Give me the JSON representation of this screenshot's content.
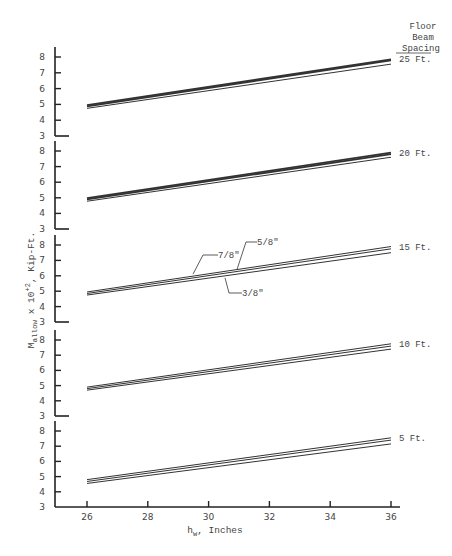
{
  "chart_data": {
    "type": "line",
    "title": "",
    "xlabel": "h_w, Inches",
    "xlabel_main": "h",
    "xlabel_sub": "w",
    "xlabel_rest": ", Inches",
    "ylabel": "M_allow x 10^+2, Kip-Ft.",
    "ylabel_main": "M",
    "ylabel_sub": "allow",
    "ylabel_mid": " x 10",
    "ylabel_sup": "+2",
    "ylabel_rest": ", Kip-Ft.",
    "x_ticks": [
      26,
      28,
      30,
      32,
      34,
      36
    ],
    "y_ticks": [
      3,
      4,
      5,
      6,
      7,
      8
    ],
    "xlim": [
      25,
      36.5
    ],
    "ylim": [
      3,
      8.5
    ],
    "legend_header": [
      "Floor",
      "Beam",
      "Spacing"
    ],
    "series_names": [
      "7/8\"",
      "5/8\"",
      "3/8\""
    ],
    "panels": [
      {
        "label": "25 Ft.",
        "series": [
          {
            "name": "7/8\"",
            "x": [
              26,
              36
            ],
            "values": [
              4.95,
              7.85
            ]
          },
          {
            "name": "5/8\"",
            "x": [
              26,
              36
            ],
            "values": [
              4.88,
              7.78
            ]
          },
          {
            "name": "3/8\"",
            "x": [
              26,
              36
            ],
            "values": [
              4.75,
              7.55
            ]
          }
        ]
      },
      {
        "label": "20 Ft.",
        "series": [
          {
            "name": "7/8\"",
            "x": [
              26,
              36
            ],
            "values": [
              4.98,
              7.9
            ]
          },
          {
            "name": "5/8\"",
            "x": [
              26,
              36
            ],
            "values": [
              4.9,
              7.8
            ]
          },
          {
            "name": "3/8\"",
            "x": [
              26,
              36
            ],
            "values": [
              4.78,
              7.6
            ]
          }
        ]
      },
      {
        "label": "15 Ft.",
        "annotations": [
          "7/8\"",
          "5/8\"",
          "3/8\""
        ],
        "series": [
          {
            "name": "7/8\"",
            "x": [
              26,
              36
            ],
            "values": [
              4.95,
              7.9
            ]
          },
          {
            "name": "5/8\"",
            "x": [
              26,
              36
            ],
            "values": [
              4.85,
              7.75
            ]
          },
          {
            "name": "3/8\"",
            "x": [
              26,
              36
            ],
            "values": [
              4.75,
              7.5
            ]
          }
        ]
      },
      {
        "label": "10 Ft.",
        "series": [
          {
            "name": "7/8\"",
            "x": [
              26,
              36
            ],
            "values": [
              4.9,
              7.75
            ]
          },
          {
            "name": "5/8\"",
            "x": [
              26,
              36
            ],
            "values": [
              4.8,
              7.6
            ]
          },
          {
            "name": "3/8\"",
            "x": [
              26,
              36
            ],
            "values": [
              4.7,
              7.4
            ]
          }
        ]
      },
      {
        "label": "5 Ft.",
        "series": [
          {
            "name": "7/8\"",
            "x": [
              26,
              36
            ],
            "values": [
              4.8,
              7.55
            ]
          },
          {
            "name": "5/8\"",
            "x": [
              26,
              36
            ],
            "values": [
              4.68,
              7.4
            ]
          },
          {
            "name": "3/8\"",
            "x": [
              26,
              36
            ],
            "values": [
              4.55,
              7.15
            ]
          }
        ]
      }
    ],
    "grid": false,
    "legend_position": "right"
  }
}
